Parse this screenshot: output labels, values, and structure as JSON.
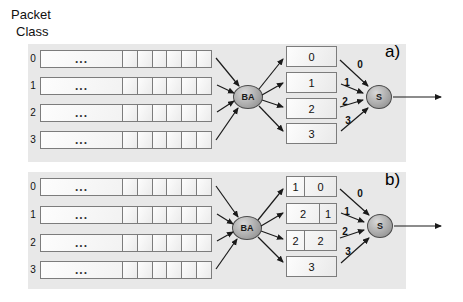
{
  "header": {
    "title_line1": "Packet",
    "title_line2": "Class"
  },
  "panels": [
    {
      "tag": "a)",
      "classifier": "BA",
      "scheduler": "S",
      "input_queues": [
        {
          "label": "0",
          "ellipsis": "..."
        },
        {
          "label": "1",
          "ellipsis": "..."
        },
        {
          "label": "2",
          "ellipsis": "..."
        },
        {
          "label": "3",
          "ellipsis": "..."
        }
      ],
      "class_queues": [
        {
          "cells": [
            {
              "label": "0"
            }
          ]
        },
        {
          "cells": [
            {
              "label": "1"
            }
          ]
        },
        {
          "cells": [
            {
              "label": "2"
            }
          ]
        },
        {
          "cells": [
            {
              "label": "3"
            }
          ]
        }
      ],
      "arrow_labels": [
        "0",
        "1",
        "2",
        "3"
      ]
    },
    {
      "tag": "b)",
      "classifier": "BA",
      "scheduler": "S",
      "input_queues": [
        {
          "label": "0",
          "ellipsis": "..."
        },
        {
          "label": "1",
          "ellipsis": "..."
        },
        {
          "label": "2",
          "ellipsis": "..."
        },
        {
          "label": "3",
          "ellipsis": "..."
        }
      ],
      "class_queues": [
        {
          "cells": [
            {
              "label": "1"
            },
            {
              "label": "0"
            }
          ]
        },
        {
          "cells": [
            {
              "label": "2"
            },
            {
              "label": "1"
            }
          ]
        },
        {
          "cells": [
            {
              "label": "2"
            },
            {
              "label": "2"
            }
          ]
        },
        {
          "cells": [
            {
              "label": "3"
            }
          ]
        }
      ],
      "arrow_labels": [
        "0",
        "1",
        "2",
        "3"
      ]
    }
  ],
  "colors": {
    "panel_bg": "#e8e8e8",
    "node_fill": "#9a9a9a",
    "box_border": "#7c7c7c",
    "arrow": "#1a1a1a"
  }
}
